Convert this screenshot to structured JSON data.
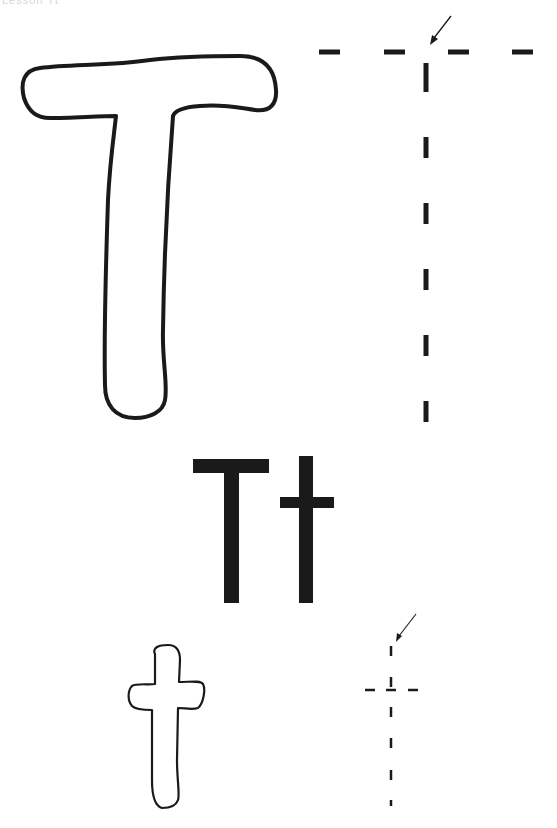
{
  "page": {
    "header_text": "Lesson Tt",
    "letter_upper": "T",
    "letter_lower": "t",
    "print_letters": "Tt",
    "ink_color": "#1a1a1a",
    "background": "#ffffff"
  },
  "sections": [
    {
      "name": "uppercase-outline",
      "description": "Bubble outline of uppercase T"
    },
    {
      "name": "uppercase-trace",
      "description": "Dashed tracing guide for uppercase T with start arrow"
    },
    {
      "name": "print-pair",
      "description": "Solid printed Tt"
    },
    {
      "name": "lowercase-outline",
      "description": "Bubble outline of lowercase t"
    },
    {
      "name": "lowercase-trace",
      "description": "Dashed tracing guide for lowercase t with start arrow"
    }
  ]
}
